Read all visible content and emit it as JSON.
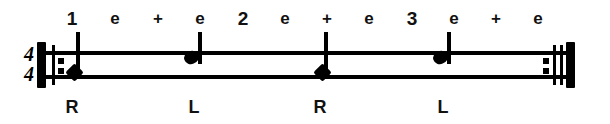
{
  "notation": {
    "kind": "percussion-rhythm-exercise",
    "time_signature": {
      "numerator": "4",
      "denominator": "4"
    },
    "staff": {
      "lines": 2,
      "left_x": 37,
      "right_x": 575,
      "top_line_y": 51,
      "bottom_line_y": 75
    },
    "barlines": {
      "left": {
        "type": "repeat-start",
        "dots": 2
      },
      "right": {
        "type": "repeat-end",
        "dots": 2
      }
    },
    "counting": [
      {
        "label": "1",
        "x": 72,
        "emphasis": "beat"
      },
      {
        "label": "e",
        "x": 115,
        "emphasis": "sub"
      },
      {
        "label": "+",
        "x": 158,
        "emphasis": "sub"
      },
      {
        "label": "e",
        "x": 200,
        "emphasis": "sub"
      },
      {
        "label": "2",
        "x": 243,
        "emphasis": "beat"
      },
      {
        "label": "e",
        "x": 285,
        "emphasis": "sub"
      },
      {
        "label": "+",
        "x": 327,
        "emphasis": "sub"
      },
      {
        "label": "e",
        "x": 369,
        "emphasis": "sub"
      },
      {
        "label": "3",
        "x": 412,
        "emphasis": "beat"
      },
      {
        "label": "e",
        "x": 454,
        "emphasis": "sub"
      },
      {
        "label": "+",
        "x": 496,
        "emphasis": "sub"
      },
      {
        "label": "e",
        "x": 538,
        "emphasis": "sub"
      }
    ],
    "notes": [
      {
        "beat": "1",
        "head": "diamond",
        "x": 72,
        "head_y": 72,
        "stem_top": 32,
        "stem_bottom": 78,
        "duration": "quarter"
      },
      {
        "beat": "2",
        "head": "round",
        "x": 194,
        "head_y": 57,
        "stem_top": 32,
        "stem_bottom": 64,
        "duration": "quarter"
      },
      {
        "beat": "3",
        "head": "diamond",
        "x": 320,
        "head_y": 72,
        "stem_top": 32,
        "stem_bottom": 78,
        "duration": "quarter"
      },
      {
        "beat": "4",
        "head": "round",
        "x": 443,
        "head_y": 57,
        "stem_top": 32,
        "stem_bottom": 64,
        "duration": "quarter"
      }
    ],
    "sticking": [
      {
        "hand": "R",
        "x": 72
      },
      {
        "hand": "L",
        "x": 194
      },
      {
        "hand": "R",
        "x": 320
      },
      {
        "hand": "L",
        "x": 443
      }
    ]
  },
  "colors": {
    "ink": "#000000",
    "text": "#111111",
    "paper": "#ffffff"
  }
}
